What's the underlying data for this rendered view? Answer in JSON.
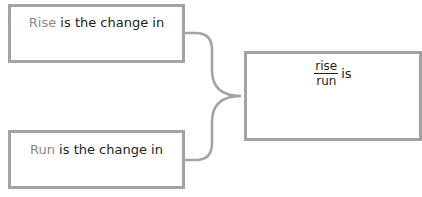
{
  "boxes": {
    "rise": {
      "term": "Rise",
      "text": " is the change in"
    },
    "run": {
      "term": "Run",
      "text": " is the change in"
    },
    "result": {
      "numerator": "rise",
      "denominator": "run",
      "text": "is"
    }
  },
  "colors": {
    "border": "#a3a3a3",
    "term": "#8a8a8a",
    "text": "#231f20",
    "connector": "#a3a3a3"
  }
}
